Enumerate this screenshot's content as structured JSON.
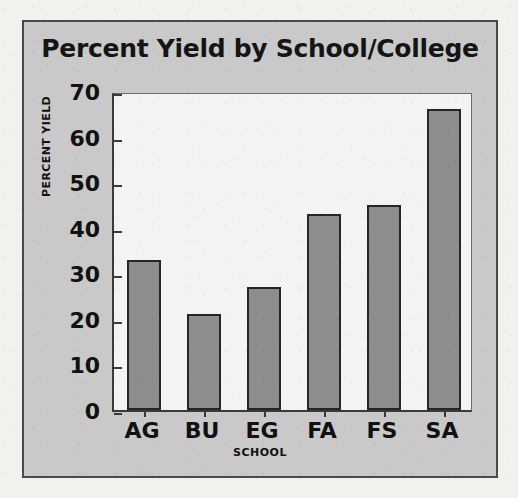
{
  "page": {
    "background_color": "#f2f1ee",
    "panel_background_color": "#c9c9c9",
    "plot_background_color": "#f4f3f1"
  },
  "chart_data": {
    "type": "bar",
    "title": "Percent Yield by School/College",
    "xlabel": "SCHOOL",
    "ylabel": "PERCENT YIELD",
    "categories": [
      "AG",
      "BU",
      "EG",
      "FA",
      "FS",
      "SA"
    ],
    "values": [
      33,
      21,
      27,
      43,
      45,
      66
    ],
    "ylim": [
      0,
      70
    ],
    "yticks": [
      0,
      10,
      20,
      30,
      40,
      50,
      60,
      70
    ],
    "ytick_labels": [
      "0",
      "10",
      "20",
      "30",
      "40",
      "50",
      "60",
      "70"
    ],
    "grid": false,
    "legend": false,
    "bar_color": "#8d8d8d",
    "bar_border_color": "#252525"
  }
}
